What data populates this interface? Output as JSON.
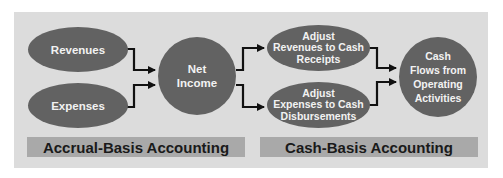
{
  "diagram": {
    "type": "flow",
    "nodes": {
      "revenues": {
        "label": "Revenues",
        "shape": "ellipse"
      },
      "expenses": {
        "label": "Expenses",
        "shape": "ellipse"
      },
      "net_income": {
        "label": "Net\nIncome",
        "shape": "circle"
      },
      "adjust_revenues": {
        "label": "Adjust\nRevenues to Cash\nReceipts",
        "shape": "ellipse"
      },
      "adjust_expenses": {
        "label": "Adjust\nExpenses to Cash\nDisbursements",
        "shape": "ellipse"
      },
      "cash_flows": {
        "label": "Cash\nFlows from\nOperating\nActivities",
        "shape": "circle"
      }
    },
    "edges": [
      {
        "from": "revenues",
        "to": "net_income"
      },
      {
        "from": "expenses",
        "to": "net_income"
      },
      {
        "from": "net_income",
        "to": "adjust_revenues"
      },
      {
        "from": "net_income",
        "to": "adjust_expenses"
      },
      {
        "from": "adjust_revenues",
        "to": "cash_flows"
      },
      {
        "from": "adjust_expenses",
        "to": "cash_flows"
      }
    ],
    "sections": {
      "accrual": "Accrual-Basis Accounting",
      "cash": "Cash-Basis Accounting"
    },
    "colors": {
      "panel": "#dcdcdc",
      "node_fill": "#626262",
      "node_text": "#f2f2f2",
      "bar_fill": "#a9a9a9",
      "bar_text": "#1a1a1a",
      "arrow": "#111111"
    }
  }
}
